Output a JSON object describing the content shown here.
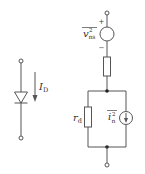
{
  "diagram": {
    "colors": {
      "line": "#555555",
      "text": "#333333",
      "background": "#ffffff"
    },
    "left_circuit": {
      "component": "diode",
      "current_label": "I",
      "current_subscript": "D"
    },
    "right_circuit": {
      "voltage_source": {
        "label_main": "v",
        "label_super": "2",
        "label_sub": "ns",
        "plus_sign": "+",
        "minus_sign": "−"
      },
      "series_resistor": {
        "label": ""
      },
      "parallel_resistor": {
        "label_main": "r",
        "label_sub": "d"
      },
      "current_source": {
        "label_main": "i",
        "label_super": "2",
        "label_sub": "n"
      }
    }
  }
}
